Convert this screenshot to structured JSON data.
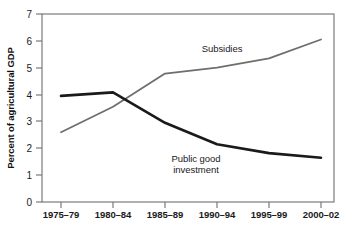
{
  "chart_data": {
    "type": "line",
    "title": "",
    "xlabel": "",
    "ylabel": "Percent of agricultural GDP",
    "categories": [
      "1975–79",
      "1980–84",
      "1985–89",
      "1990–94",
      "1995–99",
      "2000–02"
    ],
    "ylim": [
      0,
      7
    ],
    "yticks": [
      0,
      1,
      2,
      3,
      4,
      5,
      6,
      7
    ],
    "ytick_labels": [
      "0",
      "1",
      "2",
      "3",
      "4",
      "5",
      "6",
      "7"
    ],
    "grid": false,
    "legend": "inline-annotations",
    "series": [
      {
        "name": "Subsidies",
        "color": "#6e6e6e",
        "line_width": 1.8,
        "values": [
          2.6,
          3.55,
          4.78,
          5.0,
          5.35,
          6.05
        ]
      },
      {
        "name": "Public good investment",
        "color": "#1a1a1a",
        "line_width": 2.6,
        "values": [
          3.95,
          4.08,
          2.95,
          2.15,
          1.82,
          1.65
        ]
      }
    ],
    "annotations": [
      {
        "text": "Subsidies",
        "x_category": "1990–94",
        "value": 5.55
      },
      {
        "text": "Public good",
        "x_category": "1992",
        "value": 1.95
      },
      {
        "text": "investment",
        "x_category": "1992",
        "value": 1.62
      }
    ]
  },
  "axis": {
    "y_axis_title": "Percent of agricultural GDP",
    "y_tick_0": "0",
    "y_tick_1": "1",
    "y_tick_2": "2",
    "y_tick_3": "3",
    "y_tick_4": "4",
    "y_tick_5": "5",
    "y_tick_6": "6",
    "y_tick_7": "7",
    "x_tick_0": "1975–79",
    "x_tick_1": "1980–84",
    "x_tick_2": "1985–89",
    "x_tick_3": "1990–94",
    "x_tick_4": "1995–99",
    "x_tick_5": "2000–02"
  },
  "labels": {
    "subsidies": "Subsidies",
    "public_good_line1": "Public good",
    "public_good_line2": "investment"
  }
}
